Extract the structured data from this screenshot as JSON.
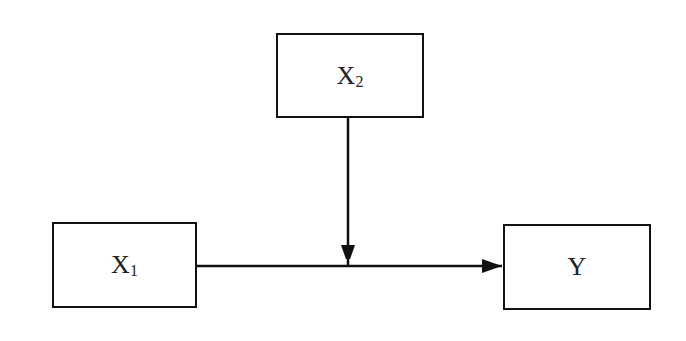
{
  "diagram": {
    "type": "moderation-model",
    "nodes": [
      {
        "id": "x2",
        "label": "X",
        "subscript": "2"
      },
      {
        "id": "x1",
        "label": "X",
        "subscript": "1"
      },
      {
        "id": "y",
        "label": "Y",
        "subscript": ""
      }
    ],
    "edges": [
      {
        "from": "x1",
        "to": "y"
      },
      {
        "from": "x2",
        "to": "x1-y-path"
      }
    ]
  }
}
